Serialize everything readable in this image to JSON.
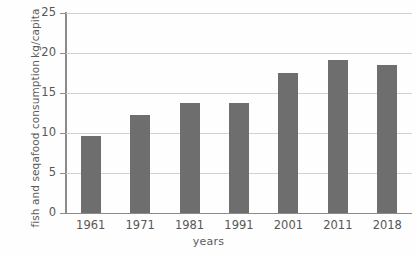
{
  "chart_data": {
    "type": "bar",
    "title": "",
    "subtitle": "",
    "xlabel": "years",
    "ylabel_line1": "fish and seqafood consumption",
    "ylabel_line2": "kg/capita",
    "categories": [
      "1961",
      "1971",
      "1981",
      "1991",
      "2001",
      "2011",
      "2018"
    ],
    "values": [
      9.6,
      12.3,
      13.7,
      13.8,
      17.5,
      19.1,
      18.5
    ],
    "ylim": [
      0,
      25
    ],
    "yticks": [
      0,
      5,
      10,
      15,
      20,
      25
    ],
    "ytick_labels": [
      "0",
      "5",
      "10",
      "15",
      "20",
      "25"
    ],
    "grid": true,
    "grid_axis": "y",
    "legend": "none",
    "bar_color": "#6e6e6e",
    "grid_color": "#d2d2d2",
    "axis_color": "#8b8b8b",
    "text_color": "#575757",
    "background_color": "#fefefe"
  }
}
